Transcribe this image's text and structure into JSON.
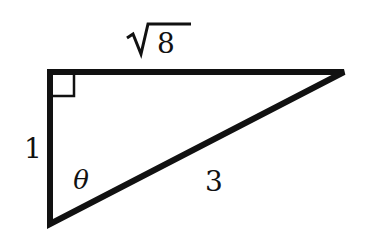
{
  "diagram": {
    "type": "right-triangle",
    "stroke_color": "#111111",
    "background": "#ffffff",
    "vertices": {
      "right_angle": [
        50,
        72
      ],
      "top_right": [
        344,
        72
      ],
      "bottom": [
        50,
        224
      ]
    },
    "labels": {
      "top_side": "8",
      "top_side_radical": "√",
      "left_side": "1",
      "hypotenuse": "3",
      "angle": "θ"
    },
    "right_angle_marker": true
  }
}
